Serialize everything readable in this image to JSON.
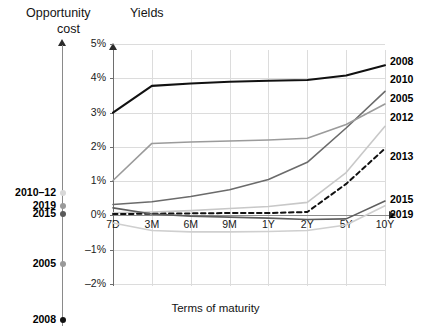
{
  "headings": {
    "opportunity_cost_line1": "Opportunity",
    "opportunity_cost_line2": "cost",
    "yields": "Yields"
  },
  "opportunity_axis": {
    "markers": [
      {
        "label": "2010–12",
        "color": "#d8d8d8"
      },
      {
        "label": "2019",
        "color": "#9a9a9a"
      },
      {
        "label": "2015",
        "color": "#5a5a5a"
      },
      {
        "label": "2005",
        "color": "#9a9a9a"
      },
      {
        "label": "2008",
        "color": "#111111"
      }
    ]
  },
  "chart_data": {
    "type": "line",
    "title": "Yields",
    "xlabel": "Terms of maturity",
    "ylabel": "",
    "x": [
      "7D",
      "3M",
      "6M",
      "9M",
      "1Y",
      "2Y",
      "5Y",
      "10Y"
    ],
    "ytick_labels": [
      "5%",
      "4%",
      "3%",
      "2%",
      "1%",
      "0%",
      "–1%",
      "–2%"
    ],
    "ytick_values": [
      5,
      4,
      3,
      2,
      1,
      0,
      -1,
      -2
    ],
    "ylim": [
      -2,
      5
    ],
    "grid": true,
    "legend_position": "right-of-plot",
    "series": [
      {
        "name": "2008",
        "color": "#111111",
        "width": 2.1,
        "dash": "none",
        "values": [
          3.0,
          3.78,
          3.85,
          3.9,
          3.93,
          3.95,
          4.08,
          4.38
        ]
      },
      {
        "name": "2010",
        "color": "#6b6b6b",
        "width": 1.6,
        "dash": "none",
        "values": [
          0.32,
          0.4,
          0.55,
          0.75,
          1.05,
          1.55,
          2.55,
          3.62
        ]
      },
      {
        "name": "2005",
        "color": "#9b9b9b",
        "width": 1.6,
        "dash": "none",
        "values": [
          1.02,
          2.1,
          2.14,
          2.17,
          2.2,
          2.25,
          2.65,
          3.25
        ]
      },
      {
        "name": "2012",
        "color": "#c8c8c8",
        "width": 1.6,
        "dash": "none",
        "values": [
          0.08,
          0.1,
          0.14,
          0.2,
          0.26,
          0.38,
          1.25,
          2.6
        ]
      },
      {
        "name": "2013",
        "color": "#111111",
        "width": 2.0,
        "dash": "dashed",
        "values": [
          0.04,
          0.05,
          0.06,
          0.07,
          0.07,
          0.1,
          0.92,
          1.95
        ]
      },
      {
        "name": "2015",
        "color": "#cfcfcf",
        "width": 1.6,
        "dash": "none",
        "values": [
          -0.22,
          -0.44,
          -0.48,
          -0.48,
          -0.47,
          -0.44,
          -0.28,
          0.28
        ]
      },
      {
        "name": "2019",
        "color": "#5e5e5e",
        "width": 1.6,
        "dash": "none",
        "values": [
          0.22,
          0.04,
          -0.02,
          -0.05,
          -0.08,
          -0.12,
          -0.1,
          0.42
        ]
      }
    ]
  }
}
